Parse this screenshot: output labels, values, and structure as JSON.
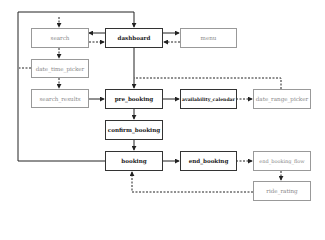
{
  "diagram": {
    "type": "flowchart",
    "nodes": {
      "search": {
        "label": "search",
        "style": "secondary"
      },
      "dashboard": {
        "label": "dashboard",
        "style": "primary"
      },
      "menu": {
        "label": "menu",
        "style": "secondary"
      },
      "date_time_picker": {
        "label": "date_time_picker",
        "style": "secondary"
      },
      "search_results": {
        "label": "search_results",
        "style": "secondary"
      },
      "pre_booking": {
        "label": "pre_booking",
        "style": "primary"
      },
      "availability_calendar": {
        "label": "availability_calendar",
        "style": "primary"
      },
      "date_range_picker": {
        "label": "date_range_picker",
        "style": "secondary"
      },
      "confirm_booking": {
        "label": "confirm_booking",
        "style": "primary"
      },
      "booking": {
        "label": "booking",
        "style": "primary"
      },
      "end_booking": {
        "label": "end_booking",
        "style": "primary"
      },
      "end_booking_flow": {
        "label": "end_booking_flow",
        "style": "secondary"
      },
      "ride_rating": {
        "label": "ride_rating",
        "style": "secondary"
      }
    },
    "edges": [
      {
        "from": "dashboard",
        "to": "search",
        "style": "solid"
      },
      {
        "from": "search",
        "to": "dashboard",
        "style": "dashed"
      },
      {
        "from": "dashboard",
        "to": "menu",
        "style": "solid"
      },
      {
        "from": "menu",
        "to": "dashboard",
        "style": "dashed"
      },
      {
        "from": "search",
        "to": "date_time_picker",
        "style": "dashed"
      },
      {
        "from": "date_time_picker",
        "to": "search_results",
        "style": "dashed"
      },
      {
        "from": "search_results",
        "to": "pre_booking",
        "style": "solid"
      },
      {
        "from": "dashboard",
        "to": "pre_booking",
        "style": "solid"
      },
      {
        "from": "pre_booking",
        "to": "availability_calendar",
        "style": "solid"
      },
      {
        "from": "availability_calendar",
        "to": "date_range_picker",
        "style": "dashed"
      },
      {
        "from": "date_range_picker",
        "to": "pre_booking",
        "style": "dashed"
      },
      {
        "from": "pre_booking",
        "to": "confirm_booking",
        "style": "solid"
      },
      {
        "from": "confirm_booking",
        "to": "booking",
        "style": "solid"
      },
      {
        "from": "booking",
        "to": "end_booking",
        "style": "solid"
      },
      {
        "from": "end_booking",
        "to": "end_booking_flow",
        "style": "dashed"
      },
      {
        "from": "end_booking_flow",
        "to": "ride_rating",
        "style": "dashed"
      },
      {
        "from": "ride_rating",
        "to": "booking",
        "style": "dashed"
      },
      {
        "from": "booking",
        "to": "dashboard",
        "style": "solid"
      },
      {
        "from": "date_time_picker",
        "to": "external",
        "style": "dashed"
      },
      {
        "from": "external",
        "to": "search",
        "style": "dashed"
      }
    ]
  }
}
